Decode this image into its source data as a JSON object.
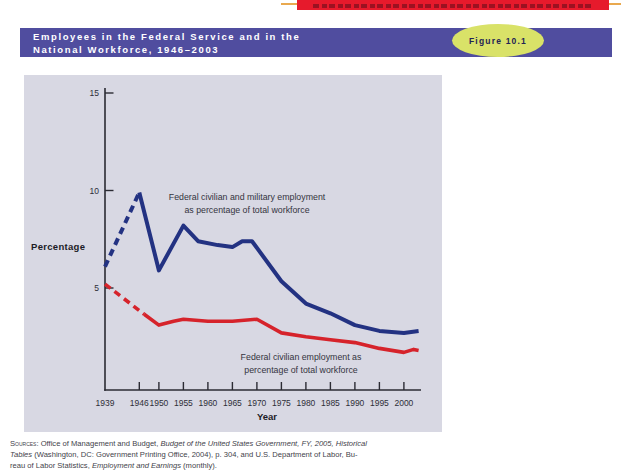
{
  "colors": {
    "top_bar_red": "#e61a2c",
    "rule_orange": "#e9a94f",
    "banner_purple": "#504d9f",
    "badge_green": "#d9e268",
    "panel_bg": "#d8d8e3",
    "line_blue": "#233282",
    "line_red": "#d6232b"
  },
  "header": {
    "title_line1": "Employees in the Federal Service and in the",
    "title_line2": "National Workforce, 1946–2003",
    "figure_label": "Figure 10.1"
  },
  "chart_data": {
    "type": "line",
    "title": "Employees in the Federal Service and in the National Workforce, 1946–2003",
    "xlabel": "Year",
    "ylabel": "Percentage",
    "xlim": [
      1939,
      2003
    ],
    "ylim": [
      0,
      15
    ],
    "grid": false,
    "x_ticks": [
      1939,
      1946,
      1950,
      1955,
      1960,
      1965,
      1970,
      1975,
      1980,
      1985,
      1990,
      1995,
      2000
    ],
    "y_ticks": [
      5,
      10,
      15
    ],
    "series": [
      {
        "name": "Federal civilian and military employment as percentage of total workforce",
        "color": "#233282",
        "width": 4,
        "dash": "7 5",
        "dashed_points": [
          [
            1939,
            6.1
          ],
          [
            1946,
            9.9
          ]
        ],
        "points": [
          [
            1946,
            9.9
          ],
          [
            1950,
            5.9
          ],
          [
            1955,
            8.2
          ],
          [
            1958,
            7.4
          ],
          [
            1962,
            7.2
          ],
          [
            1965,
            7.1
          ],
          [
            1967,
            7.4
          ],
          [
            1969,
            7.4
          ],
          [
            1975,
            5.35
          ],
          [
            1980,
            4.2
          ],
          [
            1985,
            3.7
          ],
          [
            1990,
            3.1
          ],
          [
            1995,
            2.8
          ],
          [
            2000,
            2.7
          ],
          [
            2003,
            2.8
          ]
        ]
      },
      {
        "name": "Federal civilian employment as percentage of total workforce",
        "color": "#d6232b",
        "width": 3.6,
        "dash": "7 5",
        "dashed_points": [
          [
            1939,
            5.2
          ],
          [
            1947,
            3.65
          ]
        ],
        "points": [
          [
            1947,
            3.65
          ],
          [
            1950,
            3.1
          ],
          [
            1953,
            3.3
          ],
          [
            1955,
            3.4
          ],
          [
            1960,
            3.3
          ],
          [
            1965,
            3.3
          ],
          [
            1970,
            3.4
          ],
          [
            1975,
            2.7
          ],
          [
            1980,
            2.5
          ],
          [
            1985,
            2.35
          ],
          [
            1990,
            2.2
          ],
          [
            1995,
            1.9
          ],
          [
            2000,
            1.7
          ],
          [
            2002,
            1.85
          ],
          [
            2003,
            1.8
          ]
        ]
      }
    ],
    "annotations": [
      {
        "line1": "Federal civilian and military employment",
        "line2": "as percentage of total workforce"
      },
      {
        "line1": "Federal civilian employment as",
        "line2": "percentage of total workforce"
      }
    ]
  },
  "sources": {
    "label": "Sources:",
    "line1_normal": " Office of Management and Budget, ",
    "line1_italic": "Budget of the United States Government, FY, 2005, Historical",
    "line2_italic": "Tables",
    "line2_normal": " (Washington, DC: Government Printing Office, 2004), p. 304, and U.S. Department of Labor, Bu-",
    "line3_normal1": "reau of Labor Statistics, ",
    "line3_italic": "Employment and Earnings",
    "line3_normal2": " (monthly)."
  }
}
